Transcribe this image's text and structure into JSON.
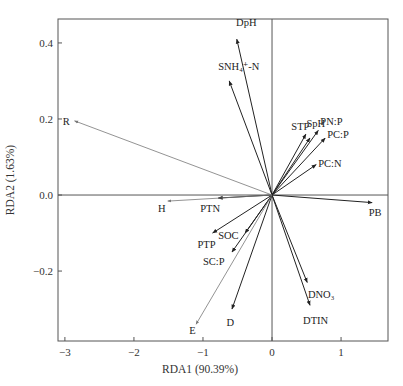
{
  "chart_data": {
    "type": "scatter",
    "subtype": "rda-biplot-vectors",
    "title": "",
    "xlabel": "RDA1 (90.39%)",
    "ylabel": "RDA2 (1.63%)",
    "xlim": [
      -3.1,
      1.68
    ],
    "ylim": [
      -0.384,
      0.463
    ],
    "xticks": [
      -3,
      -2,
      -1,
      0,
      1
    ],
    "xtick_labels": [
      "−3",
      "−2",
      "−1",
      "0",
      "1"
    ],
    "yticks": [
      -0.2,
      0.0,
      0.2,
      0.4
    ],
    "ytick_labels": [
      "−0.2",
      "0.0",
      "0.2",
      "0.4"
    ],
    "grid": false,
    "zero_lines": true,
    "legend": null,
    "series": [
      {
        "name": "response",
        "color": "#222222",
        "vectors": [
          {
            "label": "DpH",
            "x": -0.51,
            "y": 0.41,
            "lx": -0.52,
            "ly": 0.445
          },
          {
            "label": "SNH₄⁺-N",
            "x": -0.62,
            "y": 0.3,
            "lx": -0.78,
            "ly": 0.33
          },
          {
            "label": "STP",
            "x": 0.49,
            "y": 0.16,
            "lx": 0.28,
            "ly": 0.17
          },
          {
            "label": "SpH",
            "x": 0.55,
            "y": 0.15,
            "lx": 0.5,
            "ly": 0.18
          },
          {
            "label": "PN:P",
            "x": 0.67,
            "y": 0.17,
            "lx": 0.7,
            "ly": 0.185
          },
          {
            "label": "PC:P",
            "x": 0.77,
            "y": 0.15,
            "lx": 0.8,
            "ly": 0.15
          },
          {
            "label": "PC:N",
            "x": 0.64,
            "y": 0.08,
            "lx": 0.67,
            "ly": 0.075
          },
          {
            "label": "PB",
            "x": 1.45,
            "y": -0.02,
            "lx": 1.4,
            "ly": -0.055
          },
          {
            "label": "PTN",
            "x": -0.78,
            "y": -0.008,
            "lx": -1.04,
            "ly": -0.045
          },
          {
            "label": "PTP",
            "x": -0.86,
            "y": -0.1,
            "lx": -1.08,
            "ly": -0.14
          },
          {
            "label": "SOC",
            "x": -0.39,
            "y": -0.1,
            "lx": -0.78,
            "ly": -0.115
          },
          {
            "label": "SC:P",
            "x": -0.58,
            "y": -0.15,
            "lx": -1.0,
            "ly": -0.185
          },
          {
            "label": "D",
            "x": -0.58,
            "y": -0.3,
            "lx": -0.66,
            "ly": -0.345
          },
          {
            "label": "DNO₃",
            "x": 0.51,
            "y": -0.23,
            "lx": 0.52,
            "ly": -0.27
          },
          {
            "label": "DTIN",
            "x": 0.55,
            "y": -0.29,
            "lx": 0.45,
            "ly": -0.34
          }
        ]
      },
      {
        "name": "explanatory",
        "color": "#777777",
        "vectors": [
          {
            "label": "R",
            "x": -2.86,
            "y": 0.195,
            "lx": -3.03,
            "ly": 0.185
          },
          {
            "label": "H",
            "x": -1.51,
            "y": -0.016,
            "lx": -1.65,
            "ly": -0.045
          },
          {
            "label": "E",
            "x": -1.1,
            "y": -0.34,
            "lx": -1.2,
            "ly": -0.365
          }
        ]
      }
    ]
  },
  "axes": {
    "x_title": "RDA1 (90.39%)",
    "y_title": "RDA2 (1.63%)"
  }
}
